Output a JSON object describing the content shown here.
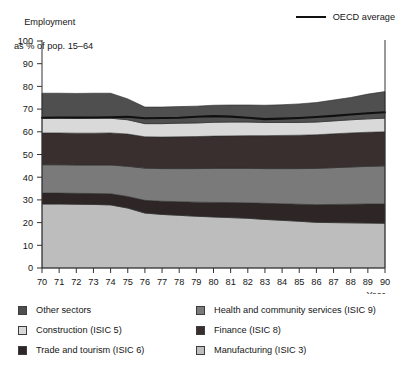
{
  "header": {
    "axis_title_line1": "Employment",
    "axis_title_line2": "as % of pop. 15–64",
    "series_legend_label": "OECD average",
    "series_legend_icon": "line-swatch"
  },
  "axes": {
    "x_axis_name": "Year",
    "y_ticks": [
      "0",
      "10",
      "20",
      "30",
      "40",
      "50",
      "60",
      "70",
      "80",
      "90",
      "100"
    ],
    "x_ticks": [
      "70",
      "71",
      "72",
      "73",
      "74",
      "75",
      "76",
      "77",
      "78",
      "79",
      "80",
      "81",
      "82",
      "83",
      "84",
      "85",
      "86",
      "87",
      "88",
      "89",
      "90"
    ]
  },
  "legend": {
    "left_items": [
      {
        "label": "Other sectors",
        "color": "#4f4f4f",
        "icon": "color-swatch"
      },
      {
        "label": "Construction (ISIC 5)",
        "color": "#d9d9d9",
        "icon": "color-swatch"
      },
      {
        "label": "Trade and tourism (ISIC 6)",
        "color": "#2e2626",
        "icon": "color-swatch"
      }
    ],
    "right_items": [
      {
        "label": "Health and community services (ISIC 9)",
        "color": "#7a7a7a",
        "icon": "color-swatch"
      },
      {
        "label": "Finance (ISIC 8)",
        "color": "#3a2f2f",
        "icon": "color-swatch"
      },
      {
        "label": "Manufacturing (ISIC 3)",
        "color": "#bdbdbd",
        "icon": "color-swatch"
      }
    ]
  },
  "chart_data": {
    "type": "area",
    "title": "",
    "subtitle": "",
    "xlabel": "Year",
    "ylabel": "Employment as % of pop. 15–64",
    "xlim": [
      70,
      90
    ],
    "ylim": [
      0,
      100
    ],
    "grid": false,
    "stacked": true,
    "legend_position": "bottom",
    "x": [
      70,
      71,
      72,
      73,
      74,
      75,
      76,
      77,
      78,
      79,
      80,
      81,
      82,
      83,
      84,
      85,
      86,
      87,
      88,
      89,
      90
    ],
    "series": [
      {
        "name": "Manufacturing (ISIC 3)",
        "color": "#bdbdbd",
        "values": [
          28.2,
          28.2,
          28.1,
          28.0,
          27.8,
          26.4,
          24.2,
          23.6,
          23.2,
          22.8,
          22.5,
          22.2,
          21.9,
          21.4,
          21.0,
          20.6,
          20.1,
          20.0,
          19.9,
          19.8,
          19.7
        ]
      },
      {
        "name": "Trade and tourism (ISIC 6)",
        "color": "#2e2626",
        "values": [
          4.8,
          4.8,
          4.8,
          4.8,
          4.9,
          5.1,
          5.6,
          5.8,
          6.0,
          6.2,
          6.4,
          6.6,
          6.8,
          7.1,
          7.3,
          7.5,
          7.8,
          8.0,
          8.2,
          8.4,
          8.5
        ]
      },
      {
        "name": "Health and community services (ISIC 9)",
        "color": "#7a7a7a",
        "values": [
          12.5,
          12.5,
          12.5,
          12.6,
          12.7,
          13.3,
          14.2,
          14.4,
          14.6,
          14.8,
          15.0,
          15.1,
          15.2,
          15.3,
          15.5,
          15.7,
          16.0,
          16.2,
          16.4,
          16.6,
          16.8
        ]
      },
      {
        "name": "Finance (ISIC 8)",
        "color": "#3a2f2f",
        "values": [
          14.0,
          14.0,
          14.0,
          14.0,
          14.1,
          14.2,
          13.8,
          13.9,
          14.0,
          14.1,
          14.2,
          14.3,
          14.4,
          14.5,
          14.6,
          14.7,
          14.8,
          14.9,
          15.0,
          15.0,
          15.0
        ]
      },
      {
        "name": "Construction (ISIC 5)",
        "color": "#d9d9d9",
        "values": [
          6.5,
          6.5,
          6.5,
          6.6,
          6.5,
          6.3,
          5.8,
          5.9,
          6.0,
          6.0,
          6.1,
          6.1,
          6.0,
          5.8,
          5.7,
          5.6,
          5.6,
          5.7,
          5.8,
          5.9,
          6.0
        ]
      },
      {
        "name": "Other sectors",
        "color": "#4f4f4f",
        "values": [
          11.0,
          11.0,
          11.0,
          11.0,
          11.0,
          9.2,
          7.3,
          7.3,
          7.3,
          7.4,
          7.5,
          7.5,
          7.5,
          7.6,
          7.8,
          8.2,
          8.6,
          9.2,
          9.8,
          10.9,
          11.7
        ]
      }
    ],
    "overlay_line": {
      "name": "OECD average",
      "color": "#101010",
      "values": [
        66.2,
        66.3,
        66.3,
        66.3,
        66.4,
        66.6,
        66.0,
        66.1,
        66.2,
        66.6,
        66.9,
        66.7,
        66.2,
        65.6,
        65.8,
        66.1,
        66.5,
        67.0,
        67.6,
        68.2,
        68.6
      ]
    }
  }
}
